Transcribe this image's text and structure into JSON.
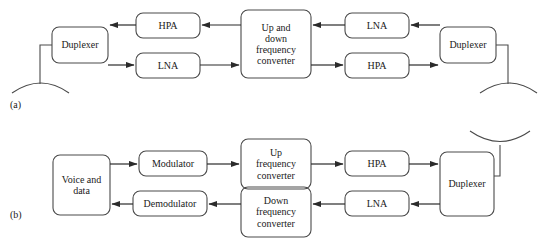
{
  "figure": {
    "type": "block-diagram",
    "background_color": "#ffffff",
    "stroke_color": "#4a4a4a",
    "text_color": "#1a1a1a",
    "width": 542,
    "height": 245
  },
  "panels": [
    {
      "id": "a",
      "label": "(a)",
      "label_x": 10,
      "label_y": 99,
      "blocks": [
        {
          "name": "duplexer-left",
          "label": "Duplexer",
          "x": 52,
          "y": 27,
          "w": 56,
          "h": 36,
          "font_size": 10
        },
        {
          "name": "hpa-left",
          "label": "HPA",
          "x": 136,
          "y": 13,
          "w": 64,
          "h": 25,
          "font_size": 10
        },
        {
          "name": "lna-left",
          "label": "LNA",
          "x": 136,
          "y": 53,
          "w": 64,
          "h": 25,
          "font_size": 10
        },
        {
          "name": "updown-conv",
          "label": "Up and\ndown\nfrequency\nconverter",
          "x": 241,
          "y": 10,
          "w": 70,
          "h": 68,
          "font_size": 10
        },
        {
          "name": "lna-right",
          "label": "LNA",
          "x": 345,
          "y": 13,
          "w": 64,
          "h": 25,
          "font_size": 10
        },
        {
          "name": "hpa-right",
          "label": "HPA",
          "x": 345,
          "y": 53,
          "w": 64,
          "h": 25,
          "font_size": 10
        },
        {
          "name": "duplexer-right",
          "label": "Duplexer",
          "x": 440,
          "y": 27,
          "w": 56,
          "h": 36,
          "font_size": 10
        }
      ],
      "antennas": [
        {
          "name": "antenna-left",
          "orientation": "down",
          "cx": 40,
          "cy": 85,
          "stem_top": 45,
          "stem_bottom": 85,
          "width": 62
        },
        {
          "name": "antenna-right",
          "orientation": "down",
          "cx": 508,
          "cy": 85,
          "stem_top": 45,
          "stem_bottom": 85,
          "width": 62
        }
      ]
    },
    {
      "id": "b",
      "label": "(b)",
      "label_x": 10,
      "label_y": 209,
      "blocks": [
        {
          "name": "voice-and-data",
          "label": "Voice and\ndata",
          "x": 53,
          "y": 155,
          "w": 57,
          "h": 60,
          "font_size": 10
        },
        {
          "name": "modulator",
          "label": "Modulator",
          "x": 139,
          "y": 151,
          "w": 68,
          "h": 25,
          "font_size": 10
        },
        {
          "name": "demodulator",
          "label": "Demodulator",
          "x": 133,
          "y": 191,
          "w": 74,
          "h": 25,
          "font_size": 10
        },
        {
          "name": "up-converter",
          "label": "Up\nfrequency\nconverter",
          "x": 241,
          "y": 139,
          "w": 70,
          "h": 50,
          "font_size": 10
        },
        {
          "name": "down-converter",
          "label": "Down\nfrequency\nconverter",
          "x": 241,
          "y": 187,
          "w": 70,
          "h": 50,
          "font_size": 10
        },
        {
          "name": "hpa-b",
          "label": "HPA",
          "x": 345,
          "y": 151,
          "w": 64,
          "h": 25,
          "font_size": 10
        },
        {
          "name": "lna-b",
          "label": "LNA",
          "x": 345,
          "y": 191,
          "w": 64,
          "h": 25,
          "font_size": 10
        },
        {
          "name": "duplexer-b",
          "label": "Duplexer",
          "x": 440,
          "y": 152,
          "w": 54,
          "h": 64,
          "font_size": 10
        }
      ],
      "antennas": [
        {
          "name": "antenna-b",
          "orientation": "up",
          "cx": 500,
          "cy": 133,
          "stem_top": 133,
          "stem_bottom": 172,
          "width": 62
        }
      ]
    }
  ],
  "signal_flow": {
    "panel_a": [
      "antenna-left -> duplexer-left",
      "up-and-down-frequency-converter -> hpa-left -> duplexer-left",
      "duplexer-left -> lna-left -> up-and-down-frequency-converter",
      "duplexer-right -> lna-right -> up-and-down-frequency-converter",
      "up-and-down-frequency-converter -> hpa-right -> duplexer-right",
      "duplexer-right -> antenna-right"
    ],
    "panel_b": [
      "voice-and-data -> modulator -> up-frequency-converter -> hpa -> duplexer -> antenna",
      "duplexer -> lna -> down-frequency-converter -> demodulator -> voice-and-data"
    ]
  }
}
